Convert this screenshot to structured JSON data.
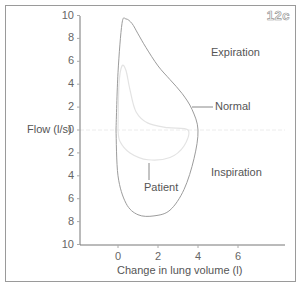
{
  "figure_label": "12c",
  "chart_data": {
    "type": "line",
    "title": "",
    "xlabel": "Change in lung volume (l)",
    "ylabel": "Flow (l/s)",
    "xlim": [
      -1,
      8
    ],
    "ylim": [
      -10,
      10
    ],
    "x_ticks": [
      "0",
      "2",
      "4",
      "6"
    ],
    "y_ticks_top": [
      "10",
      "8",
      "6",
      "4",
      "2",
      "0"
    ],
    "y_ticks_bottom": [
      "2",
      "4",
      "6",
      "8",
      "10"
    ],
    "grid": false,
    "annotations": [
      "Expiration",
      "Inspiration",
      "Normal",
      "Patient"
    ],
    "series": [
      {
        "name": "Normal",
        "color": "#b0b0b0",
        "points": [
          [
            -0.1,
            0
          ],
          [
            0,
            5
          ],
          [
            0.2,
            9.3
          ],
          [
            0.4,
            9.7
          ],
          [
            0.7,
            9.3
          ],
          [
            1.0,
            8.4
          ],
          [
            1.4,
            7.2
          ],
          [
            2.0,
            5.6
          ],
          [
            2.6,
            4.4
          ],
          [
            3.2,
            3.2
          ],
          [
            3.7,
            1.8
          ],
          [
            4.0,
            0
          ],
          [
            3.8,
            -2.5
          ],
          [
            3.3,
            -5.2
          ],
          [
            2.6,
            -7.0
          ],
          [
            1.8,
            -7.5
          ],
          [
            1.0,
            -7.4
          ],
          [
            0.4,
            -6.4
          ],
          [
            0.0,
            -4.0
          ],
          [
            -0.1,
            0
          ]
        ]
      },
      {
        "name": "Patient",
        "color": "#e6e6e6",
        "points": [
          [
            0,
            0
          ],
          [
            0.05,
            4
          ],
          [
            0.2,
            5.6
          ],
          [
            0.4,
            5.2
          ],
          [
            0.6,
            3.5
          ],
          [
            0.9,
            1.6
          ],
          [
            1.5,
            0.6
          ],
          [
            2.5,
            0.2
          ],
          [
            3.5,
            0
          ],
          [
            3.3,
            -1.4
          ],
          [
            2.6,
            -2.4
          ],
          [
            1.5,
            -2.6
          ],
          [
            0.6,
            -2.0
          ],
          [
            0.1,
            -1.0
          ],
          [
            0,
            0
          ]
        ]
      }
    ]
  },
  "labels": {
    "expiration": "Expiration",
    "inspiration": "Inspiration",
    "normal": "Normal",
    "patient": "Patient",
    "ylabel": "Flow (l/s)",
    "xlabel": "Change in lung volume (l)"
  }
}
